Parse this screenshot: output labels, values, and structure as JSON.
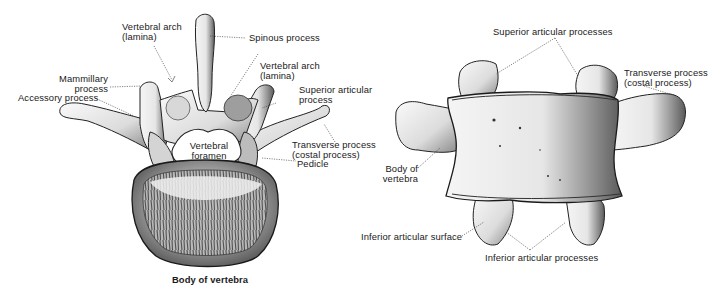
{
  "figure": {
    "left_view": {
      "name": "superior view of lumbar vertebra",
      "labels": {
        "vertebral_arch_left": "Vertebral arch\n(lamina)",
        "spinous_process": "Spinous process",
        "vertebral_arch_right": "Vertebral arch\n(lamina)",
        "mammillary_process": "Mammillary\nprocess",
        "accessory_process": "Accessory process",
        "superior_articular_process": "Superior articular\nprocess",
        "transverse_process": "Transverse process\n(costal process)",
        "vertebral_foramen": "Vertebral\nforamen",
        "pedicle": "Pedicle",
        "body_of_vertebra": "Body of vertebra"
      }
    },
    "right_view": {
      "name": "anterior view of lumbar vertebra",
      "labels": {
        "superior_articular_processes": "Superior articular processes",
        "transverse_process": "Transverse process\n(costal process)",
        "body_of_vertebra": "Body of\nvertebra",
        "inferior_articular_surface": "Inferior articular surface",
        "inferior_articular_processes": "Inferior articular processes"
      }
    },
    "colors": {
      "ink": "#1a1a1a",
      "bone_light": "#f2f2f2",
      "bone_mid": "#c8c8c8",
      "bone_dark": "#5a5a5a",
      "background": "#ffffff"
    }
  }
}
